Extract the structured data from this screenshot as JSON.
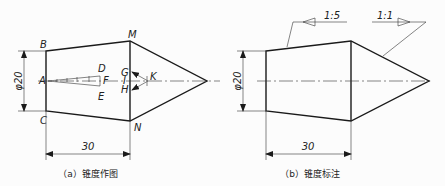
{
  "figures": [
    {
      "id": "a",
      "caption": "（a）锥度作图",
      "points": {
        "A": "A",
        "B": "B",
        "C": "C",
        "D": "D",
        "E": "E",
        "F": "F",
        "G": "G",
        "H": "H",
        "I": "I",
        "K": "K",
        "M": "M",
        "N": "N"
      },
      "diameter_label": "φ20",
      "length_label": "30"
    },
    {
      "id": "b",
      "caption": "（b）锥度标注",
      "diameter_label": "φ20",
      "length_label": "30",
      "taper_labels": [
        "1:5",
        "1:1"
      ]
    }
  ],
  "colors": {
    "line": "#1a1a1a",
    "thin": "#333333",
    "background": "#fcfcfc"
  }
}
